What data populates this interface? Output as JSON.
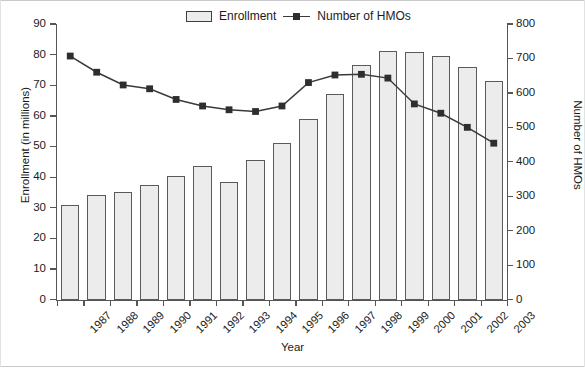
{
  "chart_data": {
    "type": "bar",
    "title": "",
    "xlabel": "Year",
    "ylabel": "Enrollment (in millions)",
    "ylabel_right": "Number of HMOs",
    "categories": [
      "1987",
      "1988",
      "1989",
      "1990",
      "1991",
      "1992",
      "1993",
      "1994",
      "1995",
      "1996",
      "1997",
      "1998",
      "1999",
      "2000",
      "2001",
      "2002",
      "2003"
    ],
    "ylim": [
      0,
      90
    ],
    "yticks": [
      0,
      10,
      20,
      30,
      40,
      50,
      60,
      70,
      80,
      90
    ],
    "ylim_right": [
      0,
      800
    ],
    "yticks_right": [
      0,
      100,
      200,
      300,
      400,
      500,
      600,
      700,
      800
    ],
    "grid": false,
    "legend_position": "top-center",
    "series": [
      {
        "name": "Enrollment",
        "type": "bar",
        "axis": "left",
        "unit": "millions",
        "values": [
          31.0,
          34.0,
          35.0,
          37.5,
          40.5,
          43.5,
          38.5,
          45.5,
          51.0,
          59.0,
          67.0,
          76.5,
          81.3,
          80.9,
          79.5,
          76.0,
          71.5
        ]
      },
      {
        "name": "Number of HMOs",
        "type": "line",
        "axis": "right",
        "unit": "HMOs",
        "values": [
          707,
          660,
          623,
          612,
          581,
          562,
          551,
          546,
          562,
          630,
          652,
          654,
          643,
          568,
          541,
          500,
          454
        ]
      }
    ],
    "colors": {
      "bar_fill": "#ececec",
      "bar_stroke": "#5a5a5a",
      "line": "#3a3a3a",
      "marker": "#2e2e2e",
      "axis": "#555555",
      "text": "#1b1b1b"
    }
  },
  "legend": {
    "entries": [
      {
        "label": "Enrollment",
        "marker": "bar-swatch"
      },
      {
        "label": "Number of HMOs",
        "marker": "line-square-marker"
      }
    ]
  }
}
